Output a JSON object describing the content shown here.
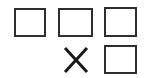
{
  "diagram": {
    "type": "grid-of-shapes",
    "columns": 3,
    "rows": 2,
    "background_color": "#ffffff",
    "stroke_color": "#2e2e2e",
    "mark_color": "#1a1a1a",
    "cells": [
      {
        "row": 1,
        "column": 1,
        "shape": "square",
        "label": ""
      },
      {
        "row": 1,
        "column": 2,
        "shape": "square",
        "label": ""
      },
      {
        "row": 1,
        "column": 3,
        "shape": "square",
        "label": ""
      },
      {
        "row": 2,
        "column": 1,
        "shape": "empty",
        "label": ""
      },
      {
        "row": 2,
        "column": 2,
        "shape": "x-mark",
        "label": "X"
      },
      {
        "row": 2,
        "column": 3,
        "shape": "square",
        "label": ""
      }
    ]
  }
}
